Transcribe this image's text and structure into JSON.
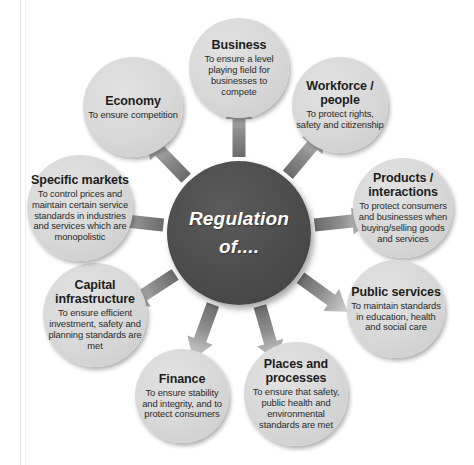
{
  "diagram": {
    "center": {
      "label": "Regulation of....",
      "fill": "#4a4a4a",
      "text_color": "#ffffff"
    },
    "node_fill": "#d7d7d7",
    "arrow_color_inner": "#6f6f6f",
    "arrow_color_outer": "#d0d0d0",
    "background": "#ffffff",
    "nodes": [
      {
        "id": "business",
        "title": "Business",
        "desc": "To ensure a level playing field for businesses to compete",
        "angle_deg": -90,
        "cx": 239,
        "cy": 68,
        "r": 50
      },
      {
        "id": "workforce-people",
        "title": "Workforce / people",
        "desc": "To protect rights, safety and citizenship",
        "angle_deg": -50,
        "cx": 340,
        "cy": 105,
        "r": 48
      },
      {
        "id": "products-interactions",
        "title": "Products / interactions",
        "desc": "To protect consumers and businesses when buying/selling goods and services",
        "angle_deg": -10,
        "cx": 403,
        "cy": 208,
        "r": 50
      },
      {
        "id": "public-services",
        "title": "Public services",
        "desc": "To maintain standards in education, health and social care",
        "cx": 396,
        "cy": 309,
        "r": 49,
        "angle_deg": 30
      },
      {
        "id": "places-and-processes",
        "title": "Places and processes",
        "desc": "To ensure that safety, public health and environmental standards are met",
        "cx": 296,
        "cy": 394,
        "r": 52,
        "angle_deg": 70
      },
      {
        "id": "finance",
        "title": "Finance",
        "desc": "To ensure stability and integrity, and to protect consumers",
        "cx": 182,
        "cy": 396,
        "r": 47,
        "angle_deg": 110
      },
      {
        "id": "capital-infrastructure",
        "title": "Capital infrastructure",
        "desc": "To ensure efficient investment, safety and planning standards are met",
        "cx": 95,
        "cy": 315,
        "r": 52,
        "angle_deg": 150
      },
      {
        "id": "specific-markets",
        "title": "Specific markets",
        "desc": "To control prices and maintain certain service standards in industries and services which are monopolistic",
        "cx": 80,
        "cy": 208,
        "r": 53,
        "angle_deg": 190
      },
      {
        "id": "economy",
        "title": "Economy",
        "desc": "To ensure competition",
        "cx": 133,
        "cy": 107,
        "r": 50,
        "angle_deg": 230
      }
    ],
    "arrows": [
      {
        "id": "arrow-to-business",
        "angle_deg": -90
      },
      {
        "id": "arrow-to-workforce-people",
        "angle_deg": -50
      },
      {
        "id": "arrow-to-products-interactions",
        "angle_deg": -6
      },
      {
        "id": "arrow-to-public-services",
        "angle_deg": 36
      },
      {
        "id": "arrow-to-places-and-processes",
        "angle_deg": 74
      },
      {
        "id": "arrow-to-finance",
        "angle_deg": 110
      },
      {
        "id": "arrow-to-capital-infrastructure",
        "angle_deg": 147
      },
      {
        "id": "arrow-to-specific-markets",
        "angle_deg": 186
      },
      {
        "id": "arrow-to-economy",
        "angle_deg": 226
      }
    ]
  }
}
